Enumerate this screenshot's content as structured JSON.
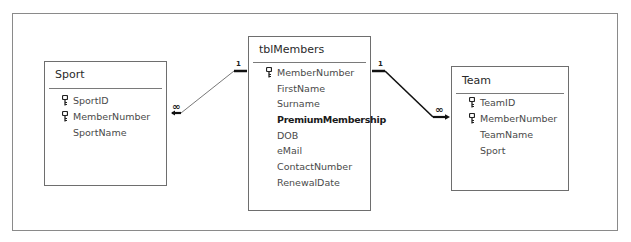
{
  "diagram": {
    "type": "database-relationships",
    "tables": [
      {
        "name": "Sport",
        "fields": [
          {
            "name": "SportID",
            "key": true,
            "bold": false
          },
          {
            "name": "MemberNumber",
            "key": true,
            "bold": false
          },
          {
            "name": "SportName",
            "key": false,
            "bold": false
          }
        ]
      },
      {
        "name": "tblMembers",
        "fields": [
          {
            "name": "MemberNumber",
            "key": true,
            "bold": false
          },
          {
            "name": "FirstName",
            "key": false,
            "bold": false
          },
          {
            "name": "Surname",
            "key": false,
            "bold": false
          },
          {
            "name": "PremiumMembership",
            "key": false,
            "bold": true
          },
          {
            "name": "DOB",
            "key": false,
            "bold": false
          },
          {
            "name": "eMail",
            "key": false,
            "bold": false
          },
          {
            "name": "ContactNumber",
            "key": false,
            "bold": false
          },
          {
            "name": "RenewalDate",
            "key": false,
            "bold": false
          }
        ]
      },
      {
        "name": "Team",
        "fields": [
          {
            "name": "TeamID",
            "key": true,
            "bold": false
          },
          {
            "name": "MemberNumber",
            "key": true,
            "bold": false
          },
          {
            "name": "TeamName",
            "key": false,
            "bold": false
          },
          {
            "name": "Sport",
            "key": false,
            "bold": false
          }
        ]
      }
    ],
    "relationships": [
      {
        "from": "tblMembers",
        "to": "Sport",
        "from_cardinality": "1",
        "to_cardinality": "∞"
      },
      {
        "from": "tblMembers",
        "to": "Team",
        "from_cardinality": "1",
        "to_cardinality": "∞"
      }
    ]
  }
}
